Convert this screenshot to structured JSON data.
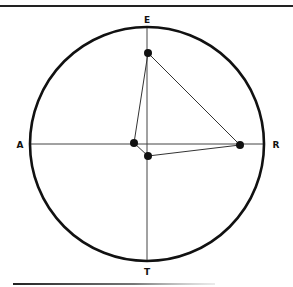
{
  "diagram": {
    "axis_labels": {
      "top": "E",
      "bottom": "T",
      "left": "A",
      "right": "R"
    },
    "circle": {
      "cx": 147,
      "cy": 144,
      "r": 117,
      "stroke": "#111111",
      "stroke_width": 2.6
    },
    "axes": {
      "vertical": {
        "x": 147,
        "y1": 27,
        "y2": 261
      },
      "horizontal": {
        "y": 144,
        "x1": 30,
        "x2": 265
      },
      "color": "#444444"
    },
    "points": [
      {
        "id": "p1",
        "x": 148,
        "y": 53
      },
      {
        "id": "p2",
        "x": 134,
        "y": 143
      },
      {
        "id": "p3",
        "x": 148,
        "y": 156
      },
      {
        "id": "p4",
        "x": 240,
        "y": 145
      }
    ],
    "edges": [
      [
        "p1",
        "p2"
      ],
      [
        "p1",
        "p4"
      ],
      [
        "p2",
        "p3"
      ],
      [
        "p3",
        "p4"
      ]
    ],
    "colors": {
      "ink": "#111111",
      "rule": "#222222"
    }
  }
}
